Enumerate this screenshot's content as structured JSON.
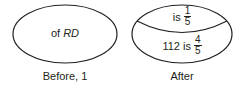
{
  "colors": {
    "stroke": "#231f20",
    "background": "#ffffff"
  },
  "before": {
    "text_prefix": "of ",
    "text_italic": "RD",
    "caption": "Before, 1"
  },
  "after": {
    "top": {
      "text": "is",
      "numerator": "1",
      "denominator": "5"
    },
    "bottom": {
      "text": "112 is",
      "numerator": "4",
      "denominator": "5"
    },
    "caption": "After"
  }
}
